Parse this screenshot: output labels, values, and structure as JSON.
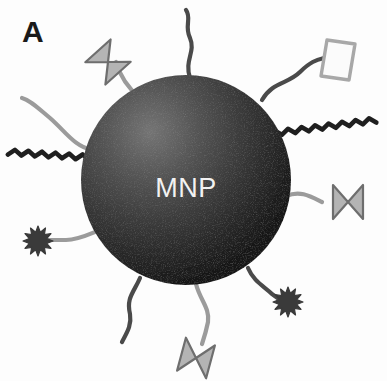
{
  "figure": {
    "panel_letter": "A",
    "core_label": "MNP",
    "background_color": "#fdfdfd"
  },
  "colors": {
    "core_highlight": "#6e6e6e",
    "core_mid": "#3c3c3c",
    "core_edge": "#141414",
    "core_label_color": "#f2f2f2",
    "panel_letter_color": "#1a1a1a",
    "tether_light": "#9b9b9b",
    "tether_dark": "#4a4a4a",
    "tether_crimped": "#1f1f1f",
    "bowtie_fill": "#b4b4b4",
    "bowtie_stroke": "#6e6e6e",
    "diamond_fill": "#fbfbfb",
    "diamond_stroke": "#a8a8a8",
    "starburst_fill": "#3a3a3a"
  },
  "core": {
    "name": "magnetic-nanoparticle-core",
    "cx": 186,
    "cy": 180,
    "r": 105,
    "label": "MNP",
    "label_x": 186,
    "label_y": 190
  },
  "ligands": [
    {
      "id": "bowtie-top-left",
      "type": "bowtie",
      "label": "antibody",
      "tether_path": "M 140 98 C 128 88 120 76 116 62",
      "tether_class": "tether-light",
      "shape_cx": 108,
      "shape_cy": 62,
      "shape_rotation": -42,
      "shape_scale": 1.0
    },
    {
      "id": "tether-top-bare",
      "type": "bare-tether",
      "label": "peg-chain",
      "tether_path": "M 190 78 C 184 60 196 52 190 38 C 184 26 192 18 186 10",
      "tether_class": "tether-dark"
    },
    {
      "id": "diamond-top-right",
      "type": "diamond",
      "label": "aptamer",
      "tether_path": "M 262 100 C 272 82 288 84 300 72 C 310 62 316 60 324 58",
      "tether_class": "tether-dark",
      "shape_cx": 338,
      "shape_cy": 60,
      "shape_rotation": 0,
      "shape_scale": 1.0
    },
    {
      "id": "crimped-upper-right",
      "type": "crimped-line",
      "label": "dna-strand",
      "tether_path": "M 268 134 L 376 120",
      "tether_class": "tether-crimped",
      "crimp_amplitude": 2.6,
      "crimp_period": 7
    },
    {
      "id": "tether-left-bare",
      "type": "bare-tether",
      "label": "peg-chain",
      "tether_path": "M 92 150 C 74 146 66 132 50 118 C 38 108 30 100 22 98",
      "tether_class": "tether-light"
    },
    {
      "id": "crimped-mid-left",
      "type": "crimped-line",
      "label": "dna-strand",
      "tether_path": "M 96 158 L 8 152",
      "tether_class": "tether-crimped",
      "crimp_amplitude": 2.6,
      "crimp_period": 7
    },
    {
      "id": "bowtie-right",
      "type": "bowtie",
      "label": "antibody",
      "tether_path": "M 286 196 C 300 190 310 196 322 202",
      "tether_class": "tether-light",
      "shape_cx": 348,
      "shape_cy": 202,
      "shape_rotation": 90,
      "shape_scale": 1.0
    },
    {
      "id": "starburst-left",
      "type": "starburst",
      "label": "fluorophore",
      "tether_path": "M 112 226 C 96 230 82 240 66 240 C 56 240 50 240 46 240",
      "tether_class": "tether-light",
      "shape_cx": 38,
      "shape_cy": 241,
      "shape_scale": 1.0
    },
    {
      "id": "starburst-bottom-right",
      "type": "starburst",
      "label": "fluorophore",
      "tether_path": "M 248 268 C 254 282 264 286 272 294 C 278 298 280 300 282 302",
      "tether_class": "tether-dark",
      "shape_cx": 288,
      "shape_cy": 302,
      "shape_scale": 1.0
    },
    {
      "id": "tether-bottom-left-bare",
      "type": "bare-tether",
      "label": "peg-chain",
      "tether_path": "M 140 278 C 134 292 126 298 130 314 C 132 326 126 334 122 342",
      "tether_class": "tether-dark"
    },
    {
      "id": "bowtie-bottom",
      "type": "bowtie",
      "label": "antibody",
      "tether_path": "M 196 284 C 200 300 210 308 208 322 C 206 332 204 338 202 344",
      "tether_class": "tether-light",
      "shape_cx": 196,
      "shape_cy": 358,
      "shape_rotation": 105,
      "shape_scale": 1.0
    }
  ]
}
